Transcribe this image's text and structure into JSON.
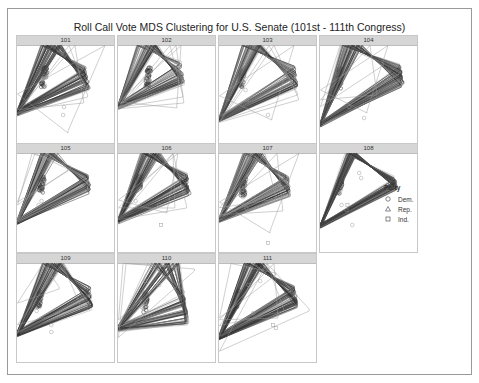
{
  "chart_data": {
    "type": "scatter",
    "title": "Roll Call Vote MDS Clustering for U.S. Senate (101st - 111th Congress)",
    "xlabel": "",
    "ylabel": "",
    "grid": false,
    "legend": {
      "title": "Party",
      "position": "right",
      "entries": [
        {
          "label": "Dem.",
          "shape": "circle"
        },
        {
          "label": "Rep.",
          "shape": "triangle"
        },
        {
          "label": "Ind.",
          "shape": "square"
        }
      ]
    },
    "facets": [
      {
        "label": "101",
        "dem": {
          "cx": 0.3,
          "cy": 0.28,
          "spread": 0.12
        },
        "rep": {
          "cx": 0.68,
          "cy": 0.3,
          "spread": 0.14
        },
        "outliers": [
          [
            0.48,
            0.62,
            "c"
          ],
          [
            0.47,
            0.7,
            "c"
          ],
          [
            0.52,
            0.88,
            "t"
          ],
          [
            0.72,
            0.52,
            "t"
          ],
          [
            0.68,
            0.58,
            "t"
          ]
        ]
      },
      {
        "label": "102",
        "dem": {
          "cx": 0.33,
          "cy": 0.28,
          "spread": 0.11
        },
        "rep": {
          "cx": 0.62,
          "cy": 0.25,
          "spread": 0.13
        },
        "outliers": [
          [
            0.6,
            0.63,
            "t"
          ],
          [
            0.67,
            0.58,
            "t"
          ],
          [
            0.66,
            0.52,
            "t"
          ]
        ]
      },
      {
        "label": "103",
        "dem": {
          "cx": 0.25,
          "cy": 0.3,
          "spread": 0.1
        },
        "rep": {
          "cx": 0.75,
          "cy": 0.3,
          "spread": 0.12
        },
        "outliers": [
          [
            0.27,
            0.45,
            "c"
          ],
          [
            0.29,
            0.55,
            "c"
          ],
          [
            0.5,
            0.7,
            "c"
          ],
          [
            0.54,
            0.75,
            "t"
          ],
          [
            0.8,
            0.5,
            "t"
          ],
          [
            0.81,
            0.55,
            "t"
          ]
        ]
      },
      {
        "label": "104",
        "dem": {
          "cx": 0.22,
          "cy": 0.3,
          "spread": 0.11
        },
        "rep": {
          "cx": 0.8,
          "cy": 0.28,
          "spread": 0.12
        },
        "outliers": [
          [
            0.3,
            0.62,
            "c"
          ],
          [
            0.45,
            0.73,
            "c"
          ],
          [
            0.48,
            0.68,
            "t"
          ],
          [
            0.58,
            0.5,
            "t"
          ],
          [
            0.65,
            0.2,
            "t"
          ]
        ]
      },
      {
        "label": "105",
        "dem": {
          "cx": 0.27,
          "cy": 0.28,
          "spread": 0.09
        },
        "rep": {
          "cx": 0.7,
          "cy": 0.28,
          "spread": 0.11
        },
        "outliers": [
          [
            0.22,
            0.52,
            "c"
          ],
          [
            0.25,
            0.48,
            "c"
          ],
          [
            0.52,
            0.18,
            "t"
          ],
          [
            0.55,
            0.15,
            "t"
          ]
        ]
      },
      {
        "label": "106",
        "dem": {
          "cx": 0.23,
          "cy": 0.27,
          "spread": 0.08
        },
        "rep": {
          "cx": 0.68,
          "cy": 0.28,
          "spread": 0.12
        },
        "outliers": [
          [
            0.18,
            0.48,
            "c"
          ],
          [
            0.42,
            0.52,
            "c"
          ],
          [
            0.5,
            0.6,
            "t"
          ],
          [
            0.58,
            0.55,
            "t"
          ],
          [
            0.44,
            0.72,
            "s"
          ],
          [
            0.7,
            0.55,
            "t"
          ]
        ]
      },
      {
        "label": "107",
        "dem": {
          "cx": 0.27,
          "cy": 0.32,
          "spread": 0.1
        },
        "rep": {
          "cx": 0.68,
          "cy": 0.3,
          "spread": 0.11
        },
        "outliers": [
          [
            0.35,
            0.45,
            "c"
          ],
          [
            0.28,
            0.55,
            "c"
          ],
          [
            0.58,
            0.46,
            "t"
          ],
          [
            0.65,
            0.58,
            "t"
          ],
          [
            0.52,
            0.8,
            "t"
          ],
          [
            0.5,
            0.9,
            "s"
          ]
        ]
      },
      {
        "label": "108",
        "dem": {
          "cx": 0.22,
          "cy": 0.3,
          "spread": 0.09
        },
        "rep": {
          "cx": 0.75,
          "cy": 0.3,
          "spread": 0.07
        },
        "outliers": [
          [
            0.22,
            0.52,
            "c"
          ],
          [
            0.28,
            0.52,
            "s"
          ],
          [
            0.27,
            0.57,
            "c"
          ],
          [
            0.33,
            0.72,
            "c"
          ],
          [
            0.4,
            0.2,
            "c"
          ],
          [
            0.42,
            0.25,
            "c"
          ]
        ]
      },
      {
        "label": "109",
        "dem": {
          "cx": 0.25,
          "cy": 0.33,
          "spread": 0.1
        },
        "rep": {
          "cx": 0.72,
          "cy": 0.32,
          "spread": 0.12
        },
        "outliers": [
          [
            0.35,
            0.62,
            "c"
          ],
          [
            0.35,
            0.69,
            "c"
          ],
          [
            0.2,
            0.48,
            "c"
          ],
          [
            0.43,
            0.26,
            "t"
          ],
          [
            0.65,
            0.45,
            "t"
          ]
        ]
      },
      {
        "label": "110",
        "dem": {
          "cx": 0.3,
          "cy": 0.35,
          "spread": 0.12
        },
        "rep": {
          "cx": 0.65,
          "cy": 0.42,
          "spread": 0.18
        },
        "outliers": [
          [
            0.35,
            0.05,
            "c"
          ],
          [
            0.28,
            0.18,
            "c"
          ],
          [
            0.42,
            0.22,
            "c"
          ],
          [
            0.6,
            0.05,
            "t"
          ],
          [
            0.78,
            0.08,
            "t"
          ],
          [
            0.68,
            0.3,
            "t"
          ]
        ]
      },
      {
        "label": "111",
        "dem": {
          "cx": 0.2,
          "cy": 0.33,
          "spread": 0.09
        },
        "rep": {
          "cx": 0.75,
          "cy": 0.3,
          "spread": 0.13
        },
        "outliers": [
          [
            0.3,
            0.22,
            "c"
          ],
          [
            0.42,
            0.18,
            "c"
          ],
          [
            0.35,
            0.5,
            "c"
          ],
          [
            0.58,
            0.12,
            "t"
          ],
          [
            0.55,
            0.62,
            "s"
          ],
          [
            0.58,
            0.65,
            "s"
          ],
          [
            0.6,
            0.55,
            "t"
          ],
          [
            0.66,
            0.48,
            "t"
          ],
          [
            0.92,
            0.48,
            "t"
          ]
        ]
      }
    ]
  },
  "legend": {
    "title": "Party",
    "dem": "Dem.",
    "rep": "Rep.",
    "ind": "Ind."
  }
}
